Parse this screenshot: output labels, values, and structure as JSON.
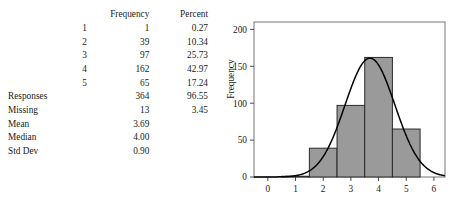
{
  "table": {
    "headers": [
      "",
      "Frequency",
      "Percent"
    ],
    "rows": [
      {
        "label": "1",
        "frequency": "1",
        "percent": "0.27",
        "indent": true
      },
      {
        "label": "2",
        "frequency": "39",
        "percent": "10.34",
        "indent": true
      },
      {
        "label": "3",
        "frequency": "97",
        "percent": "25.73",
        "indent": true
      },
      {
        "label": "4",
        "frequency": "162",
        "percent": "42.97",
        "indent": true
      },
      {
        "label": "5",
        "frequency": "65",
        "percent": "17.24",
        "indent": true
      },
      {
        "label": "Responses",
        "frequency": "364",
        "percent": "96.55",
        "indent": false
      },
      {
        "label": "Missing",
        "frequency": "13",
        "percent": "3.45",
        "indent": false
      },
      {
        "label": "Mean",
        "frequency": "3.69",
        "percent": "",
        "indent": false
      },
      {
        "label": "Median",
        "frequency": "4.00",
        "percent": "",
        "indent": false
      },
      {
        "label": "Std Dev",
        "frequency": "0.90",
        "percent": "",
        "indent": false
      }
    ]
  },
  "chart_data": {
    "type": "bar",
    "title": "",
    "xlabel": "",
    "ylabel": "Frequency",
    "categories": [
      "1",
      "2",
      "3",
      "4",
      "5"
    ],
    "values": [
      1,
      39,
      97,
      162,
      65
    ],
    "bar_edges": [
      [
        0.5,
        1.5
      ],
      [
        1.5,
        2.5
      ],
      [
        2.5,
        3.5
      ],
      [
        3.5,
        4.5
      ],
      [
        4.5,
        5.5
      ]
    ],
    "bar_fill": "#9a9a9a",
    "bar_stroke": "#2a2a2a",
    "xlim": [
      -0.5,
      6.4
    ],
    "ylim": [
      0,
      210
    ],
    "xticks": [
      0,
      1,
      2,
      3,
      4,
      5,
      6
    ],
    "xticklabels": [
      "0",
      "1",
      "2",
      "3",
      "4",
      "5",
      "6"
    ],
    "yticks": [
      0,
      50,
      100,
      150,
      200
    ],
    "yticklabels": [
      "0",
      "50",
      "100",
      "150",
      "200"
    ],
    "grid": false,
    "legend": "none",
    "overlay_curve": {
      "type": "normal",
      "mean": 3.69,
      "std_dev": 0.9,
      "scale_n": 364,
      "peak_value": 161,
      "color": "#000000"
    },
    "frame_color": "#808080"
  }
}
